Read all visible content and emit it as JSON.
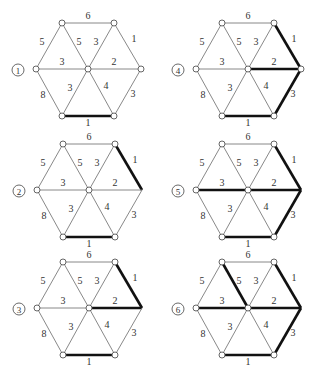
{
  "diagram": {
    "type": "weighted-graph-sequence",
    "colors": {
      "normal_edge": "#7a7a7a",
      "bold_edge": "#111111",
      "node_fill": "#ffffff",
      "node_stroke": "#555555"
    },
    "vertices": {
      "TL": [
        -26,
        -46
      ],
      "TR": [
        26,
        -46
      ],
      "R": [
        53,
        0
      ],
      "BR": [
        26,
        47
      ],
      "BL": [
        -26,
        47
      ],
      "L": [
        -52,
        0
      ],
      "C": [
        0,
        0
      ]
    },
    "edges": [
      {
        "id": "TL-TR",
        "a": "TL",
        "b": "TR",
        "weight": "6",
        "label_pos": [
          0,
          -52
        ]
      },
      {
        "id": "TL-L",
        "a": "TL",
        "b": "L",
        "weight": "5",
        "label_pos": [
          -46,
          -26
        ]
      },
      {
        "id": "TL-C",
        "a": "TL",
        "b": "C",
        "weight": "5",
        "label_pos": [
          -9,
          -26
        ]
      },
      {
        "id": "TR-C",
        "a": "TR",
        "b": "C",
        "weight": "3",
        "label_pos": [
          8,
          -26
        ]
      },
      {
        "id": "TR-R",
        "a": "TR",
        "b": "R",
        "weight": "1",
        "label_pos": [
          46,
          -29
        ]
      },
      {
        "id": "L-C",
        "a": "L",
        "b": "C",
        "weight": "3",
        "label_pos": [
          -26,
          -6
        ]
      },
      {
        "id": "C-R",
        "a": "C",
        "b": "R",
        "weight": "2",
        "label_pos": [
          26,
          -6
        ]
      },
      {
        "id": "L-BL",
        "a": "L",
        "b": "BL",
        "weight": "8",
        "label_pos": [
          -45,
          27
        ]
      },
      {
        "id": "BL-C",
        "a": "BL",
        "b": "C",
        "weight": "3",
        "label_pos": [
          -18,
          20
        ]
      },
      {
        "id": "C-BR",
        "a": "C",
        "b": "BR",
        "weight": "4",
        "label_pos": [
          18,
          18
        ]
      },
      {
        "id": "R-BR",
        "a": "R",
        "b": "BR",
        "weight": "3",
        "label_pos": [
          45,
          26
        ]
      },
      {
        "id": "BL-BR",
        "a": "BL",
        "b": "BR",
        "weight": "1",
        "label_pos": [
          0,
          55
        ]
      }
    ],
    "panels": [
      {
        "label": "1",
        "center": [
          88,
          69
        ],
        "bold": [
          "BL-BR"
        ],
        "hidden_nodes": []
      },
      {
        "label": "2",
        "center": [
          89,
          190
        ],
        "bold": [
          "BL-BR",
          "TR-R"
        ],
        "hidden_nodes": [
          "R"
        ]
      },
      {
        "label": "3",
        "center": [
          89,
          308
        ],
        "bold": [
          "BL-BR",
          "TR-R",
          "C-R"
        ],
        "hidden_nodes": [
          "R"
        ]
      },
      {
        "label": "4",
        "center": [
          248,
          69
        ],
        "bold": [
          "BL-BR",
          "TR-R",
          "C-R",
          "R-BR"
        ],
        "hidden_nodes": []
      },
      {
        "label": "5",
        "center": [
          248,
          190
        ],
        "bold": [
          "BL-BR",
          "TR-R",
          "C-R",
          "R-BR",
          "L-C"
        ],
        "hidden_nodes": [
          "R"
        ]
      },
      {
        "label": "6",
        "center": [
          248,
          308
        ],
        "bold": [
          "BL-BR",
          "TR-R",
          "C-R",
          "R-BR",
          "L-C",
          "TL-C"
        ],
        "hidden_nodes": [
          "R"
        ]
      }
    ],
    "panel_label_offset": [
      -70,
      1
    ]
  }
}
